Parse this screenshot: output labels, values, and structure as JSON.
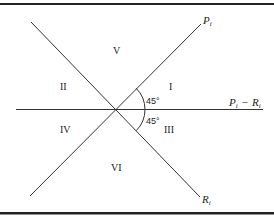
{
  "diagram": {
    "regions": {
      "I": "I",
      "II": "II",
      "III": "III",
      "IV": "IV",
      "V": "V",
      "VI": "VI"
    },
    "angles": {
      "upper": "45°",
      "lower": "45°"
    },
    "axes": {
      "p_axis": {
        "main": "P",
        "sub": "i"
      },
      "r_axis": {
        "main": "R",
        "sub": "i"
      },
      "diff_axis": {
        "left_main": "P",
        "left_sub": "i",
        "operator": "−",
        "right_main": "R",
        "right_sub": "i"
      }
    },
    "colors": {
      "line": "#333333",
      "rule": "#222222",
      "text": "#222222",
      "background": "#ffffff"
    }
  }
}
